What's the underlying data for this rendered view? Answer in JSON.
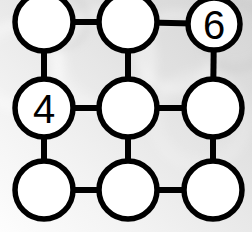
{
  "scene": {
    "title": "Number Grid Puzzle",
    "width": 252,
    "height": 232,
    "background": {
      "base_color": "#e6e6e6",
      "highlight_color": "#fbfbfb",
      "shadow_color": "#c9c9c9",
      "gradient_description": "light gray gradient, brightest toward lower-left, darker toward upper-right, with faint blurred circular bokeh shapes"
    },
    "graph": {
      "rows": 3,
      "columns": 3,
      "node_fill": "#ffffff",
      "node_stroke": "#000000",
      "node_stroke_width": 5.5,
      "node_radius": 29,
      "edge_color": "#000000",
      "edge_width": 6,
      "digit_color": "#000000",
      "digit_font_size": 40
    }
  },
  "nodes": [
    {
      "id": "r0c0",
      "label": "",
      "cx": 44,
      "cy": 22,
      "r": 29,
      "row": 0,
      "col": 0,
      "clipped": "top"
    },
    {
      "id": "r0c1",
      "label": "",
      "cx": 128,
      "cy": 22,
      "r": 29,
      "row": 0,
      "col": 1,
      "clipped": "top"
    },
    {
      "id": "r0c2",
      "label": "6",
      "cx": 214,
      "cy": 24,
      "r": 26,
      "row": 0,
      "col": 2,
      "clipped": "top-right"
    },
    {
      "id": "r1c0",
      "label": "4",
      "cx": 44,
      "cy": 108,
      "r": 29,
      "row": 1,
      "col": 0,
      "clipped": "none"
    },
    {
      "id": "r1c1",
      "label": "",
      "cx": 128,
      "cy": 108,
      "r": 29,
      "row": 1,
      "col": 1,
      "clipped": "none"
    },
    {
      "id": "r1c2",
      "label": "",
      "cx": 213,
      "cy": 108,
      "r": 29,
      "row": 1,
      "col": 2,
      "clipped": "right"
    },
    {
      "id": "r2c0",
      "label": "",
      "cx": 44,
      "cy": 190,
      "r": 29,
      "row": 2,
      "col": 0,
      "clipped": "none"
    },
    {
      "id": "r2c1",
      "label": "",
      "cx": 128,
      "cy": 190,
      "r": 29,
      "row": 2,
      "col": 1,
      "clipped": "none"
    },
    {
      "id": "r2c2",
      "label": "",
      "cx": 213,
      "cy": 190,
      "r": 29,
      "row": 2,
      "col": 2,
      "clipped": "right"
    }
  ],
  "edges": [
    {
      "id": "e-r0c0-r0c1",
      "from": "r0c0",
      "to": "r0c1",
      "orientation": "horizontal"
    },
    {
      "id": "e-r0c1-r0c2",
      "from": "r0c1",
      "to": "r0c2",
      "orientation": "horizontal"
    },
    {
      "id": "e-r1c0-r1c1",
      "from": "r1c0",
      "to": "r1c1",
      "orientation": "horizontal"
    },
    {
      "id": "e-r1c1-r1c2",
      "from": "r1c1",
      "to": "r1c2",
      "orientation": "horizontal"
    },
    {
      "id": "e-r2c0-r2c1",
      "from": "r2c0",
      "to": "r2c1",
      "orientation": "horizontal"
    },
    {
      "id": "e-r2c1-r2c2",
      "from": "r2c1",
      "to": "r2c2",
      "orientation": "horizontal"
    },
    {
      "id": "e-r0c0-r1c0",
      "from": "r0c0",
      "to": "r1c0",
      "orientation": "vertical"
    },
    {
      "id": "e-r0c1-r1c1",
      "from": "r0c1",
      "to": "r1c1",
      "orientation": "vertical"
    },
    {
      "id": "e-r0c2-r1c2",
      "from": "r0c2",
      "to": "r1c2",
      "orientation": "vertical"
    },
    {
      "id": "e-r1c0-r2c0",
      "from": "r1c0",
      "to": "r2c0",
      "orientation": "vertical"
    },
    {
      "id": "e-r1c1-r2c1",
      "from": "r1c1",
      "to": "r2c1",
      "orientation": "vertical"
    },
    {
      "id": "e-r1c2-r2c2",
      "from": "r1c2",
      "to": "r2c2",
      "orientation": "vertical"
    }
  ],
  "bokeh": [
    {
      "cx": 18,
      "cy": 66,
      "r": 50,
      "opacity": 0.5,
      "tone": "light"
    },
    {
      "cx": 104,
      "cy": 60,
      "r": 58,
      "opacity": 0.42,
      "tone": "light"
    },
    {
      "cx": 176,
      "cy": 52,
      "r": 46,
      "opacity": 0.38,
      "tone": "light"
    },
    {
      "cx": 236,
      "cy": 36,
      "r": 40,
      "opacity": 0.3,
      "tone": "dark"
    },
    {
      "cx": 60,
      "cy": 20,
      "r": 34,
      "opacity": 0.28,
      "tone": "dark"
    },
    {
      "cx": 200,
      "cy": 120,
      "r": 56,
      "opacity": 0.22,
      "tone": "light"
    }
  ]
}
